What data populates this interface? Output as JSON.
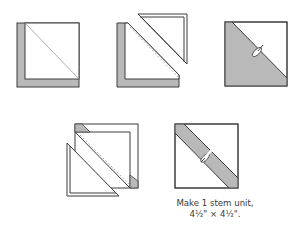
{
  "figure": {
    "type": "quilt-block-assembly-diagram",
    "colors": {
      "fabric_gray": "#b9b9b9",
      "fabric_white": "#ffffff",
      "outline": "#3c3c3c",
      "seam_line": "#9a9a9a"
    },
    "steps": [
      {
        "id": "step-1",
        "description": "White square with gray L-shaped corner, diagonal line drawn"
      },
      {
        "id": "step-2",
        "description": "Pieces separated along diagonal; stitching line shown dashed"
      },
      {
        "id": "step-3",
        "description": "Half-square triangle unit, gray lower-left, white upper-right, pressed seam"
      },
      {
        "id": "step-4",
        "description": "Square with gray corner triangles, sewn along dashed diagonal, triangle piece separated"
      },
      {
        "id": "step-5",
        "description": "Finished stem unit with gray diagonal stripe"
      }
    ],
    "caption": {
      "line1": "Make 1 stem unit,",
      "line2": "4½\" × 4½\"."
    }
  }
}
